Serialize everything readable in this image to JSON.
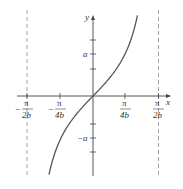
{
  "chart_data": {
    "type": "line",
    "title": "",
    "xlabel": "x",
    "ylabel": "y",
    "function": "y = a tan(bx)",
    "x_ticks": [
      {
        "num": "π",
        "den": "2b",
        "sign": "−",
        "value": -1.5708
      },
      {
        "num": "π",
        "den": "4b",
        "sign": "−",
        "value": -0.7854
      },
      {
        "num": "π",
        "den": "4b",
        "sign": "",
        "value": 0.7854
      },
      {
        "num": "π",
        "den": "2b",
        "sign": "",
        "value": 1.5708
      }
    ],
    "y_ticks": [
      {
        "label": "a",
        "value": 1
      },
      {
        "label": "−a",
        "value": -1
      }
    ],
    "asymptotes": [
      {
        "x_label": "−π/2b",
        "value": -1.5708,
        "style": "dashed"
      },
      {
        "x_label": "π/2b",
        "value": 1.5708,
        "style": "dashed"
      }
    ],
    "series": [
      {
        "name": "a tan(bx)",
        "points_bx_vs_y_over_a": [
          [
            -1.09,
            -1.93
          ],
          [
            -0.7854,
            -1.0
          ],
          [
            -0.5,
            -0.546
          ],
          [
            0,
            0
          ],
          [
            0.5,
            0.546
          ],
          [
            0.7854,
            1.0
          ],
          [
            1.09,
            1.93
          ]
        ]
      }
    ],
    "grid": false,
    "legend": "none"
  },
  "labels": {
    "x_axis": "x",
    "y_axis": "y",
    "y_pos": "a",
    "y_neg": "−a",
    "pi": "π",
    "minus": "−",
    "den_2b": "2b",
    "den_4b": "4b"
  }
}
